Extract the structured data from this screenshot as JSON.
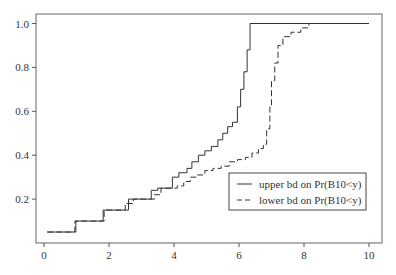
{
  "chart_data": {
    "type": "line",
    "title": "",
    "xlabel": "",
    "ylabel": "",
    "xlim": [
      -0.25,
      10.4
    ],
    "ylim": [
      0.0,
      1.02
    ],
    "grid": false,
    "legend_position": "lower right (inside)",
    "x_ticks": [
      0,
      2,
      4,
      6,
      8,
      10
    ],
    "y_ticks": [
      0.2,
      0.4,
      0.6,
      0.8,
      1.0
    ],
    "x_tick_labels": [
      "0",
      "2",
      "4",
      "6",
      "8",
      "10"
    ],
    "y_tick_labels": [
      "0.2",
      "0.4",
      "0.6",
      "0.8",
      "1.0"
    ],
    "series": [
      {
        "name": "upper bd on Pr(B10<y)",
        "style": "solid",
        "step": true,
        "x": [
          0.1,
          0.98,
          1.82,
          2.6,
          3.3,
          3.5,
          3.95,
          4.15,
          4.4,
          4.55,
          4.75,
          4.95,
          5.15,
          5.35,
          5.5,
          5.65,
          5.8,
          5.95,
          6.05,
          6.15,
          6.25,
          6.34,
          10.0
        ],
        "y": [
          0.05,
          0.1,
          0.15,
          0.2,
          0.24,
          0.25,
          0.3,
          0.32,
          0.34,
          0.37,
          0.4,
          0.42,
          0.44,
          0.47,
          0.5,
          0.53,
          0.55,
          0.62,
          0.7,
          0.78,
          0.88,
          1.0,
          1.0
        ]
      },
      {
        "name": "lower bd on Pr(B10<y)",
        "style": "dashed",
        "step": true,
        "x": [
          0.1,
          0.95,
          1.85,
          2.5,
          2.75,
          3.4,
          3.6,
          4.1,
          4.3,
          4.5,
          4.7,
          4.95,
          5.2,
          5.45,
          5.7,
          5.95,
          6.2,
          6.4,
          6.6,
          6.75,
          6.85,
          6.95,
          7.0,
          7.1,
          7.2,
          7.35,
          7.6,
          7.9,
          8.15
        ],
        "y": [
          0.05,
          0.1,
          0.15,
          0.18,
          0.2,
          0.22,
          0.25,
          0.26,
          0.28,
          0.3,
          0.31,
          0.33,
          0.34,
          0.35,
          0.37,
          0.38,
          0.39,
          0.41,
          0.43,
          0.45,
          0.52,
          0.62,
          0.74,
          0.82,
          0.9,
          0.94,
          0.96,
          0.98,
          1.0
        ]
      }
    ]
  },
  "legend": {
    "items": [
      {
        "label": "upper bd on Pr(B10<y)",
        "style": "solid"
      },
      {
        "label": "lower bd on Pr(B10<y)",
        "style": "dashed"
      }
    ]
  },
  "colors": {
    "line": "#333333",
    "axis": "#555555"
  }
}
